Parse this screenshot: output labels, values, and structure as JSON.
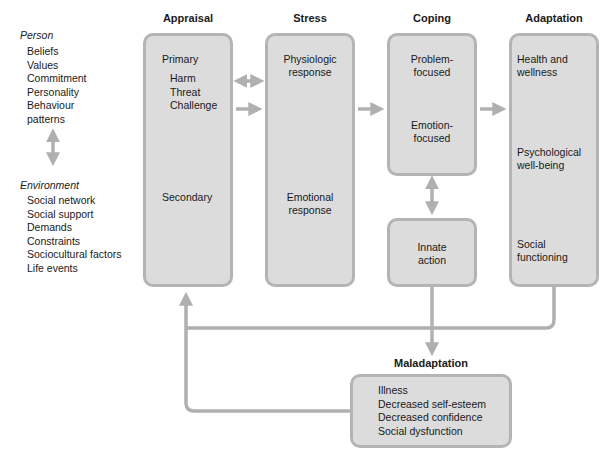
{
  "left_panel": {
    "person": {
      "title": "Person",
      "items": [
        "Beliefs",
        "Values",
        "Commitment",
        "Personality",
        "Behaviour",
        "patterns"
      ]
    },
    "environment": {
      "title": "Environment",
      "items": [
        "Social network",
        "Social support",
        "Demands",
        "Constraints",
        "Sociocultural factors",
        "Life events"
      ]
    }
  },
  "columns": {
    "appraisal": {
      "heading": "Appraisal",
      "primary": "Primary",
      "primary_items": [
        "Harm",
        "Threat",
        "Challenge"
      ],
      "secondary": "Secondary"
    },
    "stress": {
      "heading": "Stress",
      "item1_line1": "Physiologic",
      "item1_line2": "response",
      "item2_line1": "Emotional",
      "item2_line2": "response"
    },
    "coping": {
      "heading": "Coping",
      "item1_line1": "Problem-",
      "item1_line2": "focused",
      "item2_line1": "Emotion-",
      "item2_line2": "focused",
      "innate_line1": "Innate",
      "innate_line2": "action"
    },
    "adaptation": {
      "heading": "Adaptation",
      "item1_line1": "Health and",
      "item1_line2": "wellness",
      "item2_line1": "Psychological",
      "item2_line2": "well-being",
      "item3_line1": "Social",
      "item3_line2": "functioning"
    }
  },
  "maladaptation": {
    "heading": "Maladaptation",
    "items": [
      "Illness",
      "Decreased self-esteem",
      "Decreased confidence",
      "Social dysfunction"
    ]
  },
  "colors": {
    "box_fill": "#dcdcdc",
    "box_border": "#b4b4b4",
    "arrow": "#b0b0b0",
    "text": "#1a1a1a"
  }
}
